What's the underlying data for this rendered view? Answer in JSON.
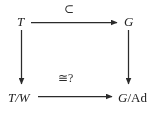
{
  "diagram": {
    "kind": "commutative-square",
    "colors": {
      "background": "#ffffff",
      "stroke": "#2b2b2b",
      "text": "#222222"
    },
    "nodes": {
      "top_left": {
        "italic": "T",
        "roman": ""
      },
      "top_right": {
        "italic": "G",
        "roman": ""
      },
      "bottom_left": {
        "italic": "T/W",
        "roman": ""
      },
      "bottom_right": {
        "italic": "G",
        "roman": "/Ad"
      }
    },
    "edges": {
      "top": {
        "label": "⊂",
        "from": "top_left",
        "to": "top_right",
        "direction": "right",
        "head": "solid-triangle"
      },
      "bottom": {
        "label": "≅?",
        "from": "bottom_left",
        "to": "bottom_right",
        "direction": "right",
        "head": "solid-triangle"
      },
      "left": {
        "label": "",
        "from": "top_left",
        "to": "bottom_left",
        "direction": "down",
        "head": "solid-triangle"
      },
      "right": {
        "label": "",
        "from": "top_right",
        "to": "bottom_right",
        "direction": "down",
        "head": "solid-triangle"
      }
    }
  }
}
